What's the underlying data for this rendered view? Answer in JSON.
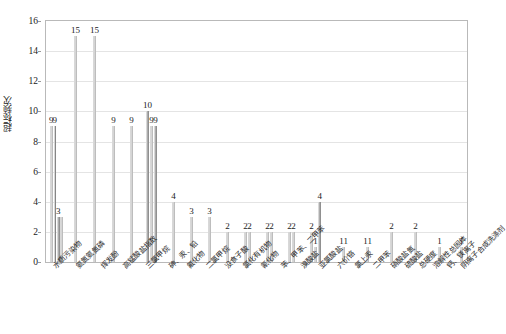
{
  "chart_data": {
    "type": "bar",
    "title": "",
    "xlabel": "",
    "ylabel": "超标频次",
    "ylim": [
      0,
      16
    ],
    "ytick_step": 2,
    "yticks": [
      "0",
      "2",
      "4",
      "6",
      "8",
      "10",
      "12",
      "14",
      "16"
    ],
    "grid": true,
    "legend": "none",
    "orientation": "vertical",
    "xtick_rotation": -45,
    "categories": [
      "水质污染物",
      "氨氮氨氮磷",
      "挥发酚",
      "高锰酸盐指数",
      "三氯甲烷",
      "砷、汞、铅",
      "氟化物",
      "二氯甲烷",
      "没食子酸",
      "氯化有机物",
      "氰化物",
      "苯、甲苯、二甲苯",
      "溴酸盐",
      "亚氯酸盐",
      "六价铬",
      "氯上汞",
      "二甲苯",
      "硝酸盐氮",
      "硫酸盐",
      "总硬度",
      "溶解性总固体",
      "钙、镁离子",
      "阴离子合成洗涤剂"
    ],
    "bars": [
      {
        "label": "9",
        "value": 9,
        "shade": "light"
      },
      {
        "label": "9",
        "value": 9,
        "shade": "dark"
      },
      {
        "label": "3",
        "value": 3,
        "shade": "dark"
      },
      {
        "label": "",
        "value": 3,
        "shade": "light"
      },
      {
        "label": "15",
        "value": 15,
        "shade": "light"
      },
      {
        "label": "15",
        "value": 15,
        "shade": "light"
      },
      {
        "label": "9",
        "value": 9,
        "shade": "light"
      },
      {
        "label": "9",
        "value": 9,
        "shade": "light"
      },
      {
        "label": "10",
        "value": 10,
        "shade": "dark"
      },
      {
        "label": "9",
        "value": 9,
        "shade": "light"
      },
      {
        "label": "9",
        "value": 9,
        "shade": "dark"
      },
      {
        "label": "4",
        "value": 4,
        "shade": "light"
      },
      {
        "label": "3",
        "value": 3,
        "shade": "light"
      },
      {
        "label": "3",
        "value": 3,
        "shade": "light"
      },
      {
        "label": "2",
        "value": 2,
        "shade": "light"
      },
      {
        "label": "2",
        "value": 2,
        "shade": "light"
      },
      {
        "label": "2",
        "value": 2,
        "shade": "light"
      },
      {
        "label": "2",
        "value": 2,
        "shade": "light"
      },
      {
        "label": "2",
        "value": 2,
        "shade": "light"
      },
      {
        "label": "2",
        "value": 2,
        "shade": "light"
      },
      {
        "label": "2",
        "value": 2,
        "shade": "light"
      },
      {
        "label": "2",
        "value": 2,
        "shade": "light"
      },
      {
        "label": "1",
        "value": 1,
        "shade": "light"
      },
      {
        "label": "4",
        "value": 4,
        "shade": "dark"
      },
      {
        "label": "11",
        "value": 1,
        "shade": "light"
      },
      {
        "label": "11",
        "value": 1,
        "shade": "light"
      },
      {
        "label": "2",
        "value": 2,
        "shade": "light"
      },
      {
        "label": "2",
        "value": 2,
        "shade": "light"
      },
      {
        "label": "1",
        "value": 1,
        "shade": "light"
      },
      {
        "label": "1",
        "value": 1,
        "shade": "light"
      }
    ]
  }
}
